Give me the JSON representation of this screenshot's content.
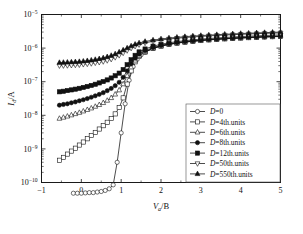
{
  "chart_data": {
    "type": "line",
    "title": "",
    "xlabel": "V_a/B",
    "xlabel_main": "V",
    "xlabel_sub": "a",
    "xlabel_tail": "/B",
    "ylabel": "I_d/A",
    "ylabel_main": "I",
    "ylabel_sub": "d",
    "ylabel_tail": "/A",
    "xlim": [
      -1,
      5
    ],
    "ylim": [
      1e-10,
      1e-05
    ],
    "yscale": "log",
    "grid": false,
    "legend_position": "lower-right-inside",
    "xticks": [
      -1,
      0,
      1,
      2,
      3,
      4,
      5
    ],
    "xticklabels": [
      "-1",
      "0",
      "1",
      "2",
      "3",
      "4",
      "5"
    ],
    "yticks": [
      1e-10,
      1e-09,
      1e-08,
      1e-07,
      1e-06,
      1e-05
    ],
    "yticklabels": [
      "10-10",
      "10-9",
      "10-8",
      "10-7",
      "10-6",
      "10-5"
    ],
    "ytick_exponents": [
      "-10",
      "-9",
      "-8",
      "-7",
      "-6",
      "-5"
    ],
    "ytick_base": "10",
    "series": [
      {
        "name": "D=0",
        "marker": "circle-open",
        "x": [
          -0.2,
          -0.1,
          0.0,
          0.1,
          0.2,
          0.3,
          0.4,
          0.5,
          0.6,
          0.7,
          0.8,
          0.9,
          1.0,
          1.1,
          1.2,
          1.3,
          1.4,
          1.5,
          1.6,
          1.8,
          2.0,
          2.2,
          2.4,
          2.6,
          2.8,
          3.0,
          3.2,
          3.4,
          3.6,
          3.8,
          4.0,
          4.2,
          4.4,
          4.6,
          4.8,
          5.0
        ],
        "y": [
          4.8e-11,
          4.8e-11,
          4.8e-11,
          4.9e-11,
          5e-11,
          5e-11,
          5.2e-11,
          5.4e-11,
          5.8e-11,
          6.5e-11,
          8.5e-11,
          4e-10,
          3e-09,
          2.2e-08,
          1.1e-07,
          2.8e-07,
          4.6e-07,
          6.3e-07,
          7.6e-07,
          9.8e-07,
          1.17e-06,
          1.31e-06,
          1.43e-06,
          1.53e-06,
          1.62e-06,
          1.7e-06,
          1.77e-06,
          1.84e-06,
          1.9e-06,
          1.96e-06,
          2.01e-06,
          2.06e-06,
          2.11e-06,
          2.15e-06,
          2.19e-06,
          2.23e-06
        ]
      },
      {
        "name": "D=4th.units",
        "marker": "square-open",
        "x": [
          -0.55,
          -0.45,
          -0.35,
          -0.25,
          -0.15,
          -0.05,
          0.05,
          0.15,
          0.25,
          0.35,
          0.45,
          0.55,
          0.65,
          0.75,
          0.85,
          0.95,
          1.05,
          1.15,
          1.25,
          1.35,
          1.45,
          1.6,
          1.8,
          2.0,
          2.2,
          2.4,
          2.6,
          2.8,
          3.0,
          3.2,
          3.4,
          3.6,
          3.8,
          4.0,
          4.2,
          4.4,
          4.6,
          4.8,
          5.0
        ],
        "y": [
          4.6e-10,
          5.6e-10,
          7e-10,
          8.6e-10,
          1.05e-09,
          1.3e-09,
          1.6e-09,
          2e-09,
          2.5e-09,
          3.1e-09,
          3.9e-09,
          4.9e-09,
          6.2e-09,
          8e-09,
          1.1e-08,
          1.7e-08,
          3.3e-08,
          8.5e-08,
          2.1e-07,
          3.9e-07,
          5.6e-07,
          7.6e-07,
          9.7e-07,
          1.14e-06,
          1.28e-06,
          1.4e-06,
          1.5e-06,
          1.59e-06,
          1.67e-06,
          1.75e-06,
          1.82e-06,
          1.88e-06,
          1.94e-06,
          1.99e-06,
          2.04e-06,
          2.09e-06,
          2.14e-06,
          2.18e-06,
          2.22e-06
        ]
      },
      {
        "name": "D=6th.units",
        "marker": "triangle-open",
        "x": [
          -0.55,
          -0.45,
          -0.35,
          -0.25,
          -0.15,
          -0.05,
          0.05,
          0.15,
          0.25,
          0.35,
          0.45,
          0.55,
          0.65,
          0.75,
          0.85,
          0.95,
          1.05,
          1.15,
          1.25,
          1.35,
          1.45,
          1.6,
          1.8,
          2.0,
          2.2,
          2.4,
          2.6,
          2.8,
          3.0,
          3.2,
          3.4,
          3.6,
          3.8,
          4.0,
          4.2,
          4.4,
          4.6,
          4.8,
          5.0
        ],
        "y": [
          8e-09,
          8.6e-09,
          9.3e-09,
          1.01e-08,
          1.1e-08,
          1.2e-08,
          1.32e-08,
          1.46e-08,
          1.62e-08,
          1.82e-08,
          2.05e-08,
          2.35e-08,
          2.75e-08,
          3.3e-08,
          4.2e-08,
          5.6e-08,
          8.5e-08,
          1.5e-07,
          2.7e-07,
          4.3e-07,
          5.9e-07,
          7.8e-07,
          9.9e-07,
          1.16e-06,
          1.3e-06,
          1.42e-06,
          1.52e-06,
          1.61e-06,
          1.69e-06,
          1.77e-06,
          1.84e-06,
          1.9e-06,
          1.96e-06,
          2.01e-06,
          2.07e-06,
          2.12e-06,
          2.16e-06,
          2.21e-06,
          2.25e-06
        ]
      },
      {
        "name": "D=8th.units",
        "marker": "circle-fill",
        "x": [
          -0.55,
          -0.45,
          -0.35,
          -0.25,
          -0.15,
          -0.05,
          0.05,
          0.15,
          0.25,
          0.35,
          0.45,
          0.55,
          0.65,
          0.75,
          0.85,
          0.95,
          1.05,
          1.15,
          1.25,
          1.35,
          1.45,
          1.6,
          1.8,
          2.0,
          2.2,
          2.4,
          2.6,
          2.8,
          3.0,
          3.2,
          3.4,
          3.6,
          3.8,
          4.0,
          4.2,
          4.4,
          4.6,
          4.8,
          5.0
        ],
        "y": [
          2e-08,
          2.1e-08,
          2.2e-08,
          2.35e-08,
          2.5e-08,
          2.7e-08,
          2.9e-08,
          3.15e-08,
          3.45e-08,
          3.8e-08,
          4.2e-08,
          4.7e-08,
          5.4e-08,
          6.3e-08,
          7.6e-08,
          9.6e-08,
          1.35e-07,
          2.1e-07,
          3.4e-07,
          5e-07,
          6.6e-07,
          8.4e-07,
          1.04e-06,
          1.2e-06,
          1.34e-06,
          1.46e-06,
          1.56e-06,
          1.65e-06,
          1.73e-06,
          1.81e-06,
          1.88e-06,
          1.94e-06,
          2e-06,
          2.06e-06,
          2.11e-06,
          2.16e-06,
          2.21e-06,
          2.25e-06,
          2.3e-06
        ]
      },
      {
        "name": "D=12th.units",
        "marker": "square-fill",
        "x": [
          -0.55,
          -0.45,
          -0.35,
          -0.25,
          -0.15,
          -0.05,
          0.05,
          0.15,
          0.25,
          0.35,
          0.45,
          0.55,
          0.65,
          0.75,
          0.85,
          0.95,
          1.05,
          1.15,
          1.25,
          1.35,
          1.45,
          1.6,
          1.8,
          2.0,
          2.2,
          2.4,
          2.6,
          2.8,
          3.0,
          3.2,
          3.4,
          3.6,
          3.8,
          4.0,
          4.2,
          4.4,
          4.6,
          4.8,
          5.0
        ],
        "y": [
          5e-08,
          5.2e-08,
          5.45e-08,
          5.7e-08,
          6e-08,
          6.35e-08,
          6.75e-08,
          7.2e-08,
          7.75e-08,
          8.4e-08,
          9.2e-08,
          1.01e-07,
          1.13e-07,
          1.29e-07,
          1.5e-07,
          1.8e-07,
          2.3e-07,
          3.2e-07,
          4.5e-07,
          6.1e-07,
          7.7e-07,
          9.4e-07,
          1.14e-06,
          1.3e-06,
          1.44e-06,
          1.56e-06,
          1.66e-06,
          1.76e-06,
          1.85e-06,
          1.93e-06,
          2e-06,
          2.07e-06,
          2.14e-06,
          2.2e-06,
          2.26e-06,
          2.31e-06,
          2.37e-06,
          2.42e-06,
          2.47e-06
        ]
      },
      {
        "name": "D=50th.units",
        "marker": "triangle-down-open",
        "x": [
          -0.55,
          -0.45,
          -0.35,
          -0.25,
          -0.15,
          -0.05,
          0.05,
          0.15,
          0.25,
          0.35,
          0.45,
          0.55,
          0.65,
          0.75,
          0.85,
          0.95,
          1.05,
          1.15,
          1.25,
          1.35,
          1.45,
          1.6,
          1.8,
          2.0,
          2.2,
          2.4,
          2.6,
          2.8,
          3.0,
          3.2,
          3.4,
          3.6,
          3.8,
          4.0,
          4.2,
          4.4,
          4.6,
          4.8,
          5.0
        ],
        "y": [
          3e-07,
          3.02e-07,
          3.05e-07,
          3.1e-07,
          3.15e-07,
          3.2e-07,
          3.3e-07,
          3.4e-07,
          3.5e-07,
          3.65e-07,
          3.8e-07,
          4e-07,
          4.3e-07,
          4.7e-07,
          5.3e-07,
          6.1e-07,
          7.2e-07,
          8.5e-07,
          1e-06,
          1.14e-06,
          1.27e-06,
          1.43e-06,
          1.6e-06,
          1.74e-06,
          1.86e-06,
          1.97e-06,
          2.06e-06,
          2.15e-06,
          2.23e-06,
          2.31e-06,
          2.38e-06,
          2.45e-06,
          2.51e-06,
          2.57e-06,
          2.63e-06,
          2.69e-06,
          2.74e-06,
          2.79e-06,
          2.84e-06
        ]
      },
      {
        "name": "D=550th.units",
        "marker": "triangle-fill",
        "x": [
          -0.55,
          -0.45,
          -0.35,
          -0.25,
          -0.15,
          -0.05,
          0.05,
          0.15,
          0.25,
          0.35,
          0.45,
          0.55,
          0.65,
          0.75,
          0.85,
          0.95,
          1.05,
          1.15,
          1.25,
          1.35,
          1.45,
          1.6,
          1.8,
          2.0,
          2.2,
          2.4,
          2.6,
          2.8,
          3.0,
          3.2,
          3.4,
          3.6,
          3.8,
          4.0,
          4.2,
          4.4,
          4.6,
          4.8,
          5.0
        ],
        "y": [
          3.7e-07,
          3.73e-07,
          3.77e-07,
          3.82e-07,
          3.88e-07,
          3.95e-07,
          4.05e-07,
          4.2e-07,
          4.35e-07,
          4.55e-07,
          4.8e-07,
          5.1e-07,
          5.5e-07,
          6e-07,
          6.7e-07,
          7.6e-07,
          8.7e-07,
          1e-06,
          1.15e-06,
          1.29e-06,
          1.42e-06,
          1.57e-06,
          1.73e-06,
          1.87e-06,
          1.99e-06,
          2.09e-06,
          2.19e-06,
          2.28e-06,
          2.36e-06,
          2.44e-06,
          2.51e-06,
          2.58e-06,
          2.65e-06,
          2.71e-06,
          2.77e-06,
          2.83e-06,
          2.89e-06,
          2.94e-06,
          3e-06
        ]
      }
    ],
    "legend": [
      {
        "label_var": "D",
        "label_rest": "=0",
        "marker": "circle-open"
      },
      {
        "label_var": "D",
        "label_rest": "=4th.units",
        "marker": "square-open"
      },
      {
        "label_var": "D",
        "label_rest": "=6th.units",
        "marker": "triangle-open"
      },
      {
        "label_var": "D",
        "label_rest": "=8th.units",
        "marker": "circle-fill"
      },
      {
        "label_var": "D",
        "label_rest": "=12th.units",
        "marker": "square-fill"
      },
      {
        "label_var": "D",
        "label_rest": "=50th.units",
        "marker": "triangle-down-open"
      },
      {
        "label_var": "D",
        "label_rest": "=550th.units",
        "marker": "triangle-fill"
      }
    ]
  }
}
